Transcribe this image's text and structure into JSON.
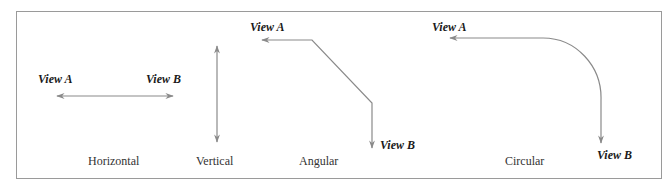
{
  "diagram": {
    "colors": {
      "line": "#8a8a8a",
      "frame": "#9a9a9a",
      "text": "#1a1a1a"
    },
    "panels": [
      {
        "id": "horizontal",
        "caption": "Horizontal",
        "view_a": "View A",
        "view_b": "View B",
        "connector": "double-headed horizontal arrow"
      },
      {
        "id": "vertical",
        "caption": "Vertical",
        "connector": "double-headed vertical arrow"
      },
      {
        "id": "angular",
        "caption": "Angular",
        "view_a": "View A",
        "view_b": "View B",
        "connector": "angled path: left arrow to View A, diagonal, down arrow to View B"
      },
      {
        "id": "circular",
        "caption": "Circular",
        "view_a": "View A",
        "view_b": "View B",
        "connector": "curved path: left arrow to View A, quarter arc, down arrow to View B"
      }
    ]
  }
}
